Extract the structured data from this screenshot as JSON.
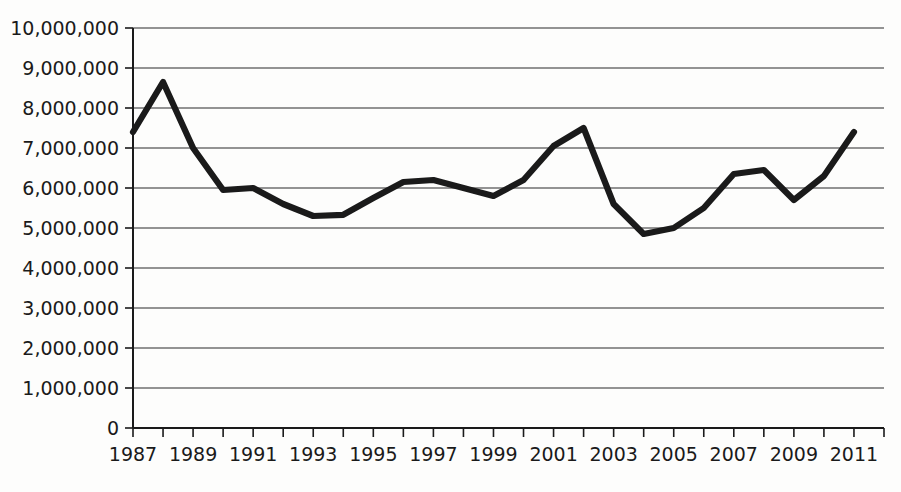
{
  "chart_data": {
    "type": "line",
    "title": "",
    "subtitle": "",
    "xlabel": "",
    "ylabel": "",
    "grid": true,
    "legend": false,
    "legend_position": "none",
    "xlim": [
      1987,
      2012
    ],
    "ylim": [
      0,
      10000000
    ],
    "y_ticks": [
      0,
      1000000,
      2000000,
      3000000,
      4000000,
      5000000,
      6000000,
      7000000,
      8000000,
      9000000,
      10000000
    ],
    "y_tick_labels": [
      "0",
      "1,000,000",
      "2,000,000",
      "3,000,000",
      "4,000,000",
      "5,000,000",
      "6,000,000",
      "7,000,000",
      "8,000,000",
      "9,000,000",
      "10,000,000"
    ],
    "x_ticks": [
      1987,
      1988,
      1989,
      1990,
      1991,
      1992,
      1993,
      1994,
      1995,
      1996,
      1997,
      1998,
      1999,
      2000,
      2001,
      2002,
      2003,
      2004,
      2005,
      2006,
      2007,
      2008,
      2009,
      2010,
      2011,
      2012
    ],
    "x_tick_labels_shown": [
      "1987",
      "1989",
      "1991",
      "1993",
      "1995",
      "1997",
      "1999",
      "2001",
      "2003",
      "2005",
      "2007",
      "2009",
      "2011"
    ],
    "x": [
      1987,
      1988,
      1989,
      1990,
      1991,
      1992,
      1993,
      1994,
      1995,
      1996,
      1997,
      1998,
      1999,
      2000,
      2001,
      2002,
      2003,
      2004,
      2005,
      2006,
      2007,
      2008,
      2009,
      2010,
      2011
    ],
    "values": [
      7400000,
      8650000,
      7000000,
      5950000,
      6000000,
      5600000,
      5300000,
      5330000,
      5750000,
      6150000,
      6200000,
      6000000,
      5800000,
      6200000,
      7050000,
      7500000,
      5600000,
      4850000,
      5000000,
      5500000,
      6350000,
      6450000,
      5700000,
      6300000,
      7400000
    ],
    "series": [
      {
        "name": "series-1",
        "color": "#1a1a1a",
        "values": [
          7400000,
          8650000,
          7000000,
          5950000,
          6000000,
          5600000,
          5300000,
          5330000,
          5750000,
          6150000,
          6200000,
          6000000,
          5800000,
          6200000,
          7050000,
          7500000,
          5600000,
          4850000,
          5000000,
          5500000,
          6350000,
          6450000,
          5700000,
          6300000,
          7400000
        ]
      }
    ]
  },
  "colors": {
    "line": "#1a1a1a",
    "grid": "#2b2b2b",
    "axis": "#1a1a1a",
    "background": "#fdfdfc",
    "text": "#1a1a1a"
  }
}
